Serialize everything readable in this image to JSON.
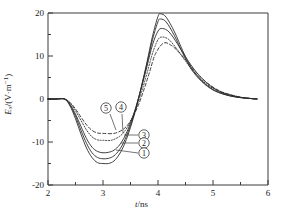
{
  "chart_data": {
    "type": "line",
    "title": "",
    "xlabel": "t/ns",
    "ylabel": "Ex/(V·m⁻¹)",
    "xlim": [
      2,
      6
    ],
    "ylim": [
      -20,
      20
    ],
    "xticks": [
      2,
      3,
      4,
      5,
      6
    ],
    "yticks": [
      -20,
      -10,
      0,
      10,
      20
    ],
    "xtick_labels": [
      "2",
      "3",
      "4",
      "5",
      "6"
    ],
    "ytick_labels": [
      "-20",
      "-10",
      "0",
      "10",
      "20"
    ],
    "minor_ticks": true,
    "grid": false,
    "legend": "inline-callouts",
    "series": [
      {
        "name": "①",
        "label": "1",
        "style": "solid",
        "min_value": -15.0,
        "min_at": 3.1,
        "max_value": 19.8,
        "max_at": 4.05,
        "x": [
          2.0,
          2.15,
          2.3,
          2.4,
          2.5,
          2.6,
          2.7,
          2.8,
          2.9,
          3.0,
          3.1,
          3.2,
          3.3,
          3.4,
          3.5,
          3.6,
          3.7,
          3.8,
          3.9,
          4.0,
          4.05,
          4.15,
          4.3,
          4.45,
          4.6,
          4.8,
          5.0,
          5.2,
          5.4,
          5.6,
          5.8
        ],
        "y": [
          0.0,
          0.0,
          0.0,
          -1.6,
          -4.6,
          -8.2,
          -11.4,
          -13.6,
          -14.8,
          -15.0,
          -15.0,
          -14.4,
          -12.8,
          -10.2,
          -6.6,
          -2.2,
          3.0,
          8.6,
          14.6,
          19.2,
          19.8,
          19.0,
          15.6,
          11.2,
          7.4,
          4.2,
          2.2,
          1.1,
          0.5,
          0.2,
          0.0
        ]
      },
      {
        "name": "②",
        "label": "2",
        "style": "solid",
        "min_value": -13.8,
        "min_at": 3.1,
        "max_value": 18.6,
        "max_at": 4.05,
        "x": [
          2.0,
          2.15,
          2.3,
          2.4,
          2.5,
          2.6,
          2.7,
          2.8,
          2.9,
          3.0,
          3.1,
          3.2,
          3.3,
          3.4,
          3.5,
          3.6,
          3.7,
          3.8,
          3.9,
          4.0,
          4.05,
          4.15,
          4.3,
          4.45,
          4.6,
          4.8,
          5.0,
          5.2,
          5.4,
          5.6,
          5.8
        ],
        "y": [
          0.0,
          0.0,
          0.0,
          -1.4,
          -4.0,
          -7.3,
          -10.3,
          -12.5,
          -13.6,
          -13.9,
          -13.8,
          -13.2,
          -11.8,
          -9.4,
          -6.1,
          -2.0,
          2.9,
          8.2,
          13.8,
          18.0,
          18.6,
          17.9,
          14.7,
          10.6,
          7.0,
          4.0,
          2.1,
          1.1,
          0.5,
          0.2,
          0.0
        ]
      },
      {
        "name": "③",
        "label": "3",
        "style": "solid",
        "min_value": -12.4,
        "min_at": 3.1,
        "max_value": 16.4,
        "max_at": 4.08,
        "x": [
          2.0,
          2.15,
          2.3,
          2.4,
          2.5,
          2.6,
          2.7,
          2.8,
          2.9,
          3.0,
          3.1,
          3.2,
          3.3,
          3.4,
          3.5,
          3.6,
          3.7,
          3.8,
          3.9,
          4.0,
          4.08,
          4.2,
          4.35,
          4.5,
          4.7,
          4.9,
          5.1,
          5.3,
          5.5,
          5.7,
          5.8
        ],
        "y": [
          0.0,
          0.0,
          0.0,
          -1.2,
          -3.5,
          -6.4,
          -9.2,
          -11.2,
          -12.2,
          -12.5,
          -12.4,
          -11.9,
          -10.7,
          -8.6,
          -5.6,
          -1.8,
          2.7,
          7.6,
          12.6,
          15.8,
          16.4,
          15.6,
          12.9,
          9.8,
          6.2,
          3.6,
          1.9,
          1.0,
          0.4,
          0.1,
          0.0
        ]
      },
      {
        "name": "④",
        "label": "4",
        "style": "dotted",
        "min_value": -9.6,
        "min_at": 3.15,
        "max_value": 14.4,
        "max_at": 4.08,
        "x": [
          2.0,
          2.15,
          2.3,
          2.4,
          2.5,
          2.6,
          2.7,
          2.8,
          2.9,
          3.0,
          3.15,
          3.3,
          3.4,
          3.5,
          3.6,
          3.7,
          3.8,
          3.9,
          4.0,
          4.08,
          4.2,
          4.35,
          4.5,
          4.7,
          4.9,
          5.1,
          5.3,
          5.5,
          5.7,
          5.8
        ],
        "y": [
          0.0,
          0.0,
          0.0,
          -0.9,
          -2.7,
          -5.0,
          -7.2,
          -8.8,
          -9.5,
          -9.6,
          -9.6,
          -8.7,
          -7.4,
          -5.2,
          -2.2,
          1.6,
          6.0,
          10.6,
          13.8,
          14.4,
          13.8,
          11.5,
          8.8,
          5.6,
          3.3,
          1.8,
          0.9,
          0.4,
          0.1,
          0.0
        ]
      },
      {
        "name": "⑤",
        "label": "5",
        "style": "dashed",
        "min_value": -8.0,
        "min_at": 3.2,
        "max_value": 13.0,
        "max_at": 4.1,
        "x": [
          2.0,
          2.15,
          2.3,
          2.4,
          2.5,
          2.6,
          2.7,
          2.8,
          2.9,
          3.0,
          3.2,
          3.35,
          3.45,
          3.55,
          3.65,
          3.75,
          3.85,
          3.95,
          4.1,
          4.25,
          4.4,
          4.55,
          4.75,
          4.95,
          5.15,
          5.35,
          5.55,
          5.7,
          5.8
        ],
        "y": [
          0.0,
          0.0,
          0.0,
          -0.8,
          -2.3,
          -4.2,
          -6.0,
          -7.3,
          -7.9,
          -8.0,
          -8.0,
          -7.2,
          -6.0,
          -4.0,
          -1.2,
          2.4,
          6.4,
          10.4,
          13.0,
          12.4,
          10.6,
          8.4,
          5.4,
          3.2,
          1.7,
          0.9,
          0.3,
          0.1,
          0.0
        ]
      }
    ],
    "callouts": [
      {
        "label": "⑤",
        "series": "5"
      },
      {
        "label": "④",
        "series": "4"
      },
      {
        "label": "③",
        "series": "3"
      },
      {
        "label": "②",
        "series": "2"
      },
      {
        "label": "①",
        "series": "1"
      }
    ]
  },
  "axes": {
    "y_label_symbol": "E",
    "y_label_sub": "x",
    "y_label_unit": "/(V·m",
    "y_label_sup": "−1",
    "y_label_close": ")",
    "x_label_symbol": "t",
    "x_label_unit": "/ns"
  },
  "colors": {
    "line": "#2b2b2b",
    "axis": "#3a3a3a",
    "text": "#1a1a1a",
    "background": "#ffffff"
  }
}
